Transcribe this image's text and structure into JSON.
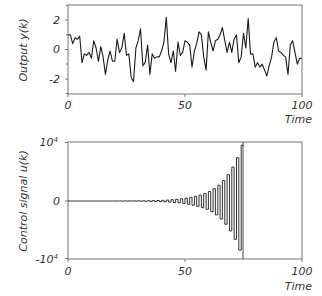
{
  "chart_data": [
    {
      "type": "line",
      "title": "",
      "xlabel": "Time",
      "ylabel": "Output  y(k)",
      "xlim": [
        0,
        100
      ],
      "ylim": [
        -3,
        3
      ],
      "xticks": [
        "0",
        "50",
        "100"
      ],
      "yticks": [
        "2",
        "0",
        "-2"
      ],
      "yminor_ticks": [
        -3,
        -1,
        1,
        3
      ],
      "grid": false,
      "legend": null,
      "series": [
        {
          "name": "y(k)",
          "x": [
            0,
            1,
            2,
            3,
            4,
            5,
            6,
            7,
            8,
            9,
            10,
            11,
            12,
            13,
            14,
            15,
            16,
            17,
            18,
            19,
            20,
            21,
            22,
            23,
            24,
            25,
            26,
            27,
            28,
            29,
            30,
            31,
            32,
            33,
            34,
            35,
            36,
            37,
            38,
            39,
            40,
            41,
            42,
            43,
            44,
            45,
            46,
            47,
            48,
            49,
            50,
            51,
            52,
            53,
            54,
            55,
            56,
            57,
            58,
            59,
            60,
            61,
            62,
            63,
            64,
            65,
            66,
            67,
            68,
            69,
            70,
            71,
            72,
            73,
            74,
            75,
            76,
            77,
            78,
            79,
            80,
            81,
            82,
            83,
            84,
            85,
            86,
            87,
            88,
            89,
            90,
            91,
            92,
            93,
            94,
            95,
            96,
            97,
            98,
            99,
            100
          ],
          "values": [
            1.0,
            1.0,
            0.4,
            0.8,
            0.7,
            0.9,
            -0.9,
            -0.3,
            -0.4,
            -0.2,
            -0.6,
            0.6,
            0.1,
            -0.8,
            0.2,
            -0.5,
            -1.7,
            -0.7,
            -0.1,
            -0.8,
            -0.8,
            0.7,
            -0.2,
            0.1,
            1.1,
            -0.4,
            -0.3,
            -1.9,
            -2.2,
            0.1,
            0.6,
            1.4,
            -1.1,
            -0.9,
            0.3,
            -1.7,
            -0.3,
            -0.6,
            -0.5,
            -0.5,
            -0.1,
            0.5,
            2.2,
            -0.3,
            -0.9,
            -0.1,
            -1.5,
            0.5,
            -0.4,
            -0.2,
            0.6,
            0.5,
            0.3,
            -1.2,
            -0.1,
            0.4,
            1.2,
            1.0,
            -0.5,
            -1.4,
            1.2,
            0.5,
            -0.1,
            0.6,
            0.7,
            1.0,
            1.5,
            0.6,
            -0.2,
            0.5,
            -0.2,
            0.7,
            1.0,
            -0.9,
            -0.5,
            1.1,
            0.1,
            2.1,
            -0.3,
            -0.3,
            -1.2,
            -0.9,
            -1.2,
            -1.0,
            -1.4,
            -1.8,
            -1.1,
            -0.5,
            0.5,
            0.8,
            -0.1,
            -0.2,
            -0.4,
            -0.5,
            -1.7,
            0.3,
            0.6,
            -0.2,
            -1.0,
            -0.6,
            -0.6
          ]
        }
      ]
    },
    {
      "type": "line",
      "title": "",
      "xlabel": "Time",
      "ylabel": "Control  signal  u(k)",
      "xlim": [
        0,
        100
      ],
      "ylim": [
        -10000,
        10000
      ],
      "xticks": [
        "0",
        "50",
        "100"
      ],
      "yticks": [
        "10^4",
        "0",
        "-10^4"
      ],
      "grid": false,
      "legend": null,
      "annotations": [
        "vertical line at Time ≈ 75 spanning full plot height"
      ],
      "series": [
        {
          "name": "u(k)",
          "step": "zero-order-hold, alternating sign, exponentially growing amplitude",
          "x": [
            0,
            10,
            20,
            30,
            35,
            40,
            45,
            50,
            55,
            60,
            62,
            64,
            66,
            68,
            70,
            72,
            74
          ],
          "amplitude": [
            0,
            0,
            5,
            30,
            60,
            120,
            250,
            500,
            900,
            1600,
            2100,
            2700,
            3500,
            4500,
            5800,
            7400,
            9500
          ]
        }
      ]
    }
  ],
  "plots": {
    "top": {
      "ylabel": "Output  y(k)",
      "xlabel": "Time",
      "xticks": [
        "0",
        "50",
        "100"
      ],
      "yticks": [
        "2",
        "0",
        "-2"
      ]
    },
    "bottom": {
      "ylabel": "Control  signal  u(k)",
      "xlabel": "Time",
      "xticks": [
        "0",
        "50",
        "100"
      ],
      "ytick_top_base": "10",
      "ytick_top_exp": "4",
      "ytick_mid": "0",
      "ytick_bot_base": "-10",
      "ytick_bot_exp": "4"
    }
  },
  "colors": {
    "line": "#1a1a1a",
    "frame": "#555555",
    "background": "#ffffff"
  }
}
